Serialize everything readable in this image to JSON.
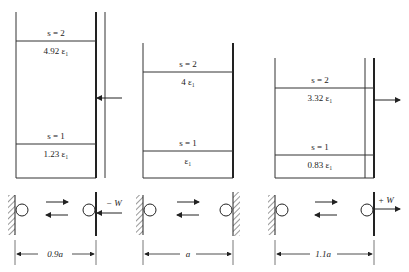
{
  "panels": [
    {
      "id": "compressed",
      "level2": {
        "label": "s = 2",
        "energy": "4.92 ε₁"
      },
      "level1": {
        "label": "s = 1",
        "energy": "1.23 ε₁"
      },
      "work_label": "− W",
      "width_label": "0.9a"
    },
    {
      "id": "reference",
      "level2": {
        "label": "s = 2",
        "energy": "4 ε₁"
      },
      "level1": {
        "label": "s = 1",
        "energy": "ε₁"
      },
      "width_label": "a"
    },
    {
      "id": "expanded",
      "level2": {
        "label": "s = 2",
        "energy": "3.32 ε₁"
      },
      "level1": {
        "label": "s = 1",
        "energy": "0.83 ε₁"
      },
      "work_label": "+ W",
      "width_label": "1.1a"
    }
  ],
  "colors": {
    "ink": "#222222",
    "background": "#ffffff"
  }
}
